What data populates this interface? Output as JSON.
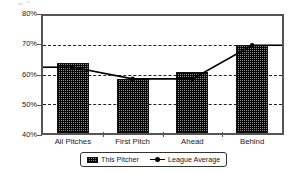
{
  "chart_data": {
    "type": "bar",
    "title": "",
    "subtitle": "",
    "xlabel": "",
    "ylabel": "",
    "categories": [
      "All Pitches",
      "First Pitch",
      "Ahead",
      "Behind"
    ],
    "ylim": [
      40,
      80
    ],
    "ytick_labels": [
      "80%",
      "70%",
      "60%",
      "50%",
      "40%"
    ],
    "ytick_values": [
      80,
      70,
      60,
      50,
      40
    ],
    "grid": true,
    "gridlines_at": [
      70,
      60,
      50
    ],
    "legend_position": "bottom-center",
    "series": [
      {
        "name": "This Pitcher",
        "type": "bar",
        "values": [
          64,
          58.5,
          61,
          70
        ]
      },
      {
        "name": "League Average",
        "type": "line",
        "values": [
          62.5,
          58.5,
          58.5,
          70
        ]
      }
    ]
  },
  "legend": {
    "items": [
      {
        "label": "This Pitcher"
      },
      {
        "label": "League Average"
      }
    ]
  },
  "colors": {
    "bar_fill": "#8d8d8d",
    "bar_border": "#111111",
    "line": "#000000",
    "axis": "#555555",
    "grid": "#222222",
    "background": "#ffffff",
    "text": "#1a1a1a"
  }
}
